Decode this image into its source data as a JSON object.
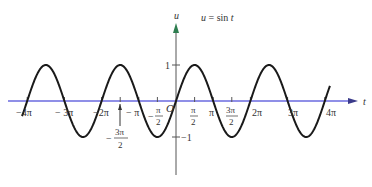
{
  "chart_data": {
    "type": "line",
    "title": "u = sin t",
    "xlabel": "t",
    "ylabel": "u",
    "function": "sin",
    "xlim": [
      -13.0,
      13.6
    ],
    "ylim": [
      -2.0,
      2.1
    ],
    "grid": false,
    "legend": "none",
    "series": [
      {
        "name": "u = sin t",
        "x_range": [
          -13.0,
          13.0
        ],
        "color": "#1a1a1a"
      }
    ],
    "x_ticks": [
      {
        "value": -12.566,
        "label": "-4π"
      },
      {
        "value": -9.425,
        "label": "-3π"
      },
      {
        "value": -6.283,
        "label": "-2π"
      },
      {
        "value": -4.712,
        "label": "-3π/2"
      },
      {
        "value": -3.1416,
        "label": "-π"
      },
      {
        "value": -1.5708,
        "label": "-π/2"
      },
      {
        "value": 1.5708,
        "label": "π/2"
      },
      {
        "value": 3.1416,
        "label": "π"
      },
      {
        "value": 4.712,
        "label": "3π/2"
      },
      {
        "value": 6.283,
        "label": "2π"
      },
      {
        "value": 9.425,
        "label": "3π"
      },
      {
        "value": 12.566,
        "label": "4π"
      }
    ],
    "y_ticks": [
      {
        "value": 1,
        "label": "1"
      },
      {
        "value": -1,
        "label": "-1"
      }
    ],
    "origin_label": "O",
    "colors": {
      "curve": "#1a1a1a",
      "x_axis": "#6a6adf",
      "y_axis": "#555555",
      "y_arrow": "#2e7d4f"
    }
  },
  "labels": {
    "title": "u = sin t",
    "u": "u",
    "t": "t",
    "origin": "O",
    "one": "1",
    "minus_one": "−1",
    "neg4pi": "−4π",
    "neg3pi": "− 3π",
    "neg2pi": "−2π",
    "negpi": "− π",
    "neg3pi2_num": "3π",
    "neg3pi2_den": "2",
    "negpi2_num": "π",
    "negpi2_den": "2",
    "pi2_num": "π",
    "pi2_den": "2",
    "pi": "π",
    "pi3_2_num": "3π",
    "pi3_2_den": "2",
    "twopi": "2π",
    "threepi": "3π",
    "fourpi": "4π"
  }
}
